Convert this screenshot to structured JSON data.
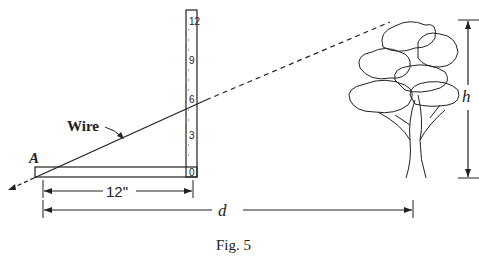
{
  "figure": {
    "caption": "Fig. 5",
    "point_label": "A",
    "wire_label": "Wire",
    "ruler_base_label": "12\"",
    "distance_label": "d",
    "height_label": "h",
    "ruler_ticks": [
      "0",
      "3",
      "6",
      "9",
      "12"
    ],
    "colors": {
      "ink": "#222222",
      "background": "#ffffff"
    }
  }
}
